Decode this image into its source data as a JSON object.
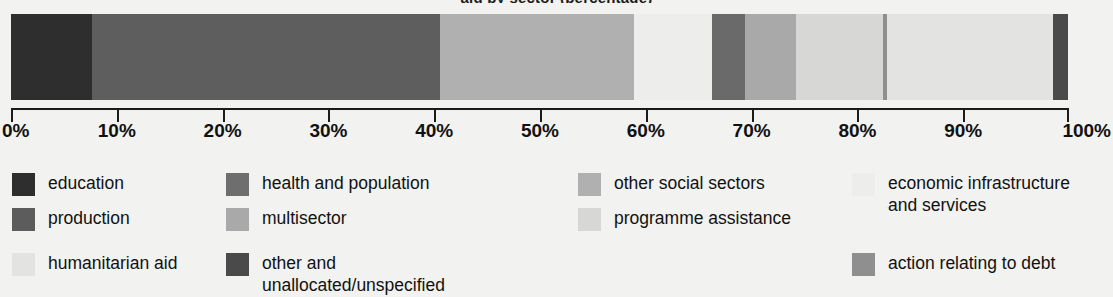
{
  "title": "aid by sector (percentage)",
  "chart_data": {
    "type": "bar",
    "orientation": "horizontal-stacked",
    "title": "aid by sector (percentage)",
    "xlabel": "",
    "ylabel": "",
    "xlim": [
      0,
      100
    ],
    "grid": false,
    "legend_position": "bottom",
    "categories": [
      "total aid"
    ],
    "tick_labels": [
      "0%",
      "10%",
      "20%",
      "30%",
      "40%",
      "50%",
      "60%",
      "70%",
      "80%",
      "90%",
      "100%"
    ],
    "tick_values": [
      0,
      10,
      20,
      30,
      40,
      50,
      60,
      70,
      80,
      90,
      100
    ],
    "series": [
      {
        "name": "education",
        "value": 7.7,
        "start": 0.0,
        "end": 7.7,
        "color": "#2e2e2e"
      },
      {
        "name": "health and population",
        "value": 32.9,
        "start": 7.7,
        "end": 40.6,
        "color": "#5e5e5e"
      },
      {
        "name": "other social sectors",
        "value": 18.3,
        "start": 40.6,
        "end": 58.9,
        "color": "#b0b0b0"
      },
      {
        "name": "economic infrastructure and services",
        "value": 7.4,
        "start": 58.9,
        "end": 66.3,
        "color": "#ededeb"
      },
      {
        "name": "production",
        "value": 3.1,
        "start": 66.3,
        "end": 69.4,
        "color": "#6a6a6a"
      },
      {
        "name": "multisector",
        "value": 4.9,
        "start": 69.4,
        "end": 74.3,
        "color": "#a9a9a9"
      },
      {
        "name": "programme assistance",
        "value": 8.2,
        "start": 74.3,
        "end": 82.5,
        "color": "#d7d7d5"
      },
      {
        "name": "action relating to debt",
        "value": 0.4,
        "start": 82.5,
        "end": 82.9,
        "color": "#8f8f8f"
      },
      {
        "name": "humanitarian aid",
        "value": 15.7,
        "start": 82.9,
        "end": 98.6,
        "color": "#e3e3e1"
      },
      {
        "name": "other and unallocated/unspecified",
        "value": 1.4,
        "start": 98.6,
        "end": 100.0,
        "color": "#4a4a4a"
      }
    ]
  },
  "legend": {
    "columns": [
      {
        "items": [
          {
            "label": "education",
            "color": "#2e2e2e"
          },
          {
            "label": "production",
            "color": "#5c5c5c"
          },
          {
            "label": "humanitarian aid",
            "color": "#e3e3e1"
          }
        ]
      },
      {
        "items": [
          {
            "label": "health and population",
            "color": "#6e6e6e"
          },
          {
            "label": "multisector",
            "color": "#a9a9a9"
          },
          {
            "label": "other and unallocated/unspecified",
            "color": "#4a4a4a"
          }
        ]
      },
      {
        "items": [
          {
            "label": "other social sectors",
            "color": "#b0b0b0"
          },
          {
            "label": "programme assistance",
            "color": "#d7d7d5"
          }
        ]
      },
      {
        "items": [
          {
            "label": "economic infrastructure\nand services",
            "color": "#ededeb"
          },
          {
            "label": "action relating to debt",
            "color": "#8f8f8f"
          }
        ]
      }
    ]
  }
}
